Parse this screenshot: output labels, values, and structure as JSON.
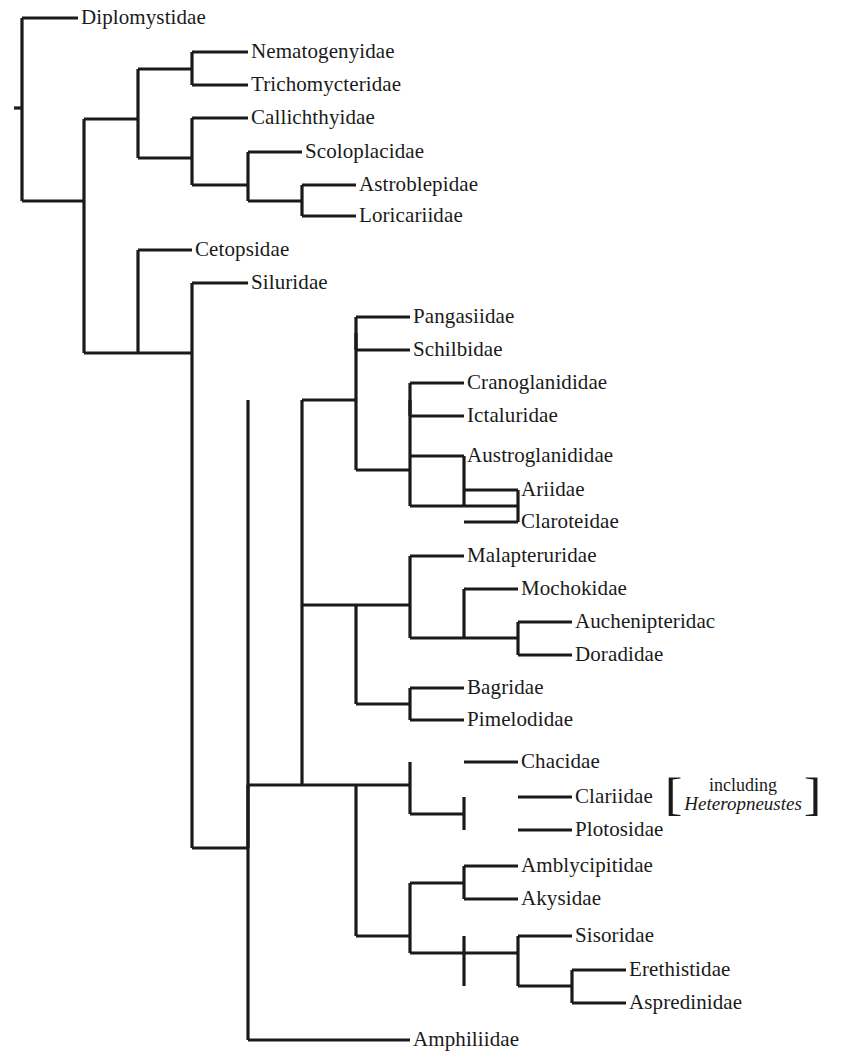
{
  "figure": {
    "kind": "cladogram",
    "line_color": "#1a1a1a",
    "background_color": "#ffffff",
    "line_width": 3.2
  },
  "tips": [
    {
      "id": "diplomystidae",
      "label": "Diplomystidae",
      "branch_x1": 22,
      "branch_x2": 78,
      "y": 18,
      "label_x": 81
    },
    {
      "id": "nematogenyidae",
      "label": "Nematogenyidae",
      "branch_x1": 192,
      "branch_x2": 248,
      "y": 52,
      "label_x": 251
    },
    {
      "id": "trichomycteridae",
      "label": "Trichomycteridae",
      "branch_x1": 192,
      "branch_x2": 248,
      "y": 85,
      "label_x": 251
    },
    {
      "id": "callichthyidae",
      "label": "Callichthyidae",
      "branch_x1": 192,
      "branch_x2": 248,
      "y": 118,
      "label_x": 251
    },
    {
      "id": "scoloplacidae",
      "label": "Scoloplacidae",
      "branch_x1": 248,
      "branch_x2": 302,
      "y": 152,
      "label_x": 305
    },
    {
      "id": "astroblepidae",
      "label": "Astroblepidae",
      "branch_x1": 302,
      "branch_x2": 356,
      "y": 185,
      "label_x": 359
    },
    {
      "id": "loricariidae",
      "label": "Loricariidae",
      "branch_x1": 302,
      "branch_x2": 356,
      "y": 216,
      "label_x": 359
    },
    {
      "id": "cetopsidae",
      "label": "Cetopsidae",
      "branch_x1": 138,
      "branch_x2": 192,
      "y": 250,
      "label_x": 195
    },
    {
      "id": "siluridae",
      "label": "Siluridae",
      "branch_x1": 192,
      "branch_x2": 248,
      "y": 283,
      "label_x": 251
    },
    {
      "id": "pangasiidae",
      "label": "Pangasiidae",
      "branch_x1": 356,
      "branch_x2": 410,
      "y": 317,
      "label_x": 413
    },
    {
      "id": "schilbidae",
      "label": "Schilbidae",
      "branch_x1": 356,
      "branch_x2": 410,
      "y": 350,
      "label_x": 413
    },
    {
      "id": "cranoglanididae",
      "label": "Cranoglanididae",
      "branch_x1": 410,
      "branch_x2": 464,
      "y": 383,
      "label_x": 467
    },
    {
      "id": "ictaluridae",
      "label": "Ictaluridae",
      "branch_x1": 410,
      "branch_x2": 464,
      "y": 416,
      "label_x": 467
    },
    {
      "id": "austroglanididae",
      "label": "Austroglanididae",
      "branch_x1": 410,
      "branch_x2": 464,
      "y": 456,
      "label_x": 467
    },
    {
      "id": "ariidae",
      "label": "Ariidae",
      "branch_x1": 464,
      "branch_x2": 518,
      "y": 490,
      "label_x": 521
    },
    {
      "id": "claroteidae",
      "label": "Claroteidae",
      "branch_x1": 464,
      "branch_x2": 518,
      "y": 522,
      "label_x": 521
    },
    {
      "id": "malapteruridae",
      "label": "Malapteruridae",
      "branch_x1": 410,
      "branch_x2": 464,
      "y": 556,
      "label_x": 467
    },
    {
      "id": "mochokidae",
      "label": "Mochokidae",
      "branch_x1": 464,
      "branch_x2": 518,
      "y": 589,
      "label_x": 521
    },
    {
      "id": "auchenipteridae",
      "label": "Auchenipteridac",
      "branch_x1": 518,
      "branch_x2": 572,
      "y": 622,
      "label_x": 575
    },
    {
      "id": "doradidae",
      "label": "Doradidae",
      "branch_x1": 518,
      "branch_x2": 572,
      "y": 655,
      "label_x": 575
    },
    {
      "id": "bagridae",
      "label": "Bagridae",
      "branch_x1": 410,
      "branch_x2": 464,
      "y": 688,
      "label_x": 467
    },
    {
      "id": "pimelodidae",
      "label": "Pimelodidae",
      "branch_x1": 410,
      "branch_x2": 464,
      "y": 720,
      "label_x": 467
    },
    {
      "id": "chacidae",
      "label": "Chacidae",
      "branch_x1": 464,
      "branch_x2": 518,
      "y": 762,
      "label_x": 521
    },
    {
      "id": "clariidae",
      "label": "Clariidae",
      "branch_x1": 518,
      "branch_x2": 572,
      "y": 797,
      "label_x": 575
    },
    {
      "id": "plotosidae",
      "label": "Plotosidae",
      "branch_x1": 518,
      "branch_x2": 572,
      "y": 830,
      "label_x": 575
    },
    {
      "id": "amblycipitidae",
      "label": "Amblycipitidae",
      "branch_x1": 464,
      "branch_x2": 518,
      "y": 866,
      "label_x": 521
    },
    {
      "id": "akysidae",
      "label": "Akysidae",
      "branch_x1": 464,
      "branch_x2": 518,
      "y": 899,
      "label_x": 521
    },
    {
      "id": "sisoridae",
      "label": "Sisoridae",
      "branch_x1": 518,
      "branch_x2": 572,
      "y": 936,
      "label_x": 575
    },
    {
      "id": "erethistidae",
      "label": "Erethistidae",
      "branch_x1": 572,
      "branch_x2": 626,
      "y": 970,
      "label_x": 629
    },
    {
      "id": "aspredinidae",
      "label": "Aspredinidae",
      "branch_x1": 572,
      "branch_x2": 626,
      "y": 1003,
      "label_x": 629
    },
    {
      "id": "amphiliidae",
      "label": "Amphiliidae",
      "branch_x1": 356,
      "branch_x2": 410,
      "y": 1040,
      "label_x": 413
    }
  ],
  "nodes": [
    {
      "id": "n-root",
      "x": 22,
      "y_top": 18,
      "y_bottom": 201,
      "stem_x1": 14,
      "stem_x2": 22,
      "stem_y": 108
    },
    {
      "id": "n-siluriformes",
      "x": 84,
      "y_top": 119,
      "y_bottom": 353,
      "stem_x1": 22,
      "stem_x2": 84,
      "stem_y": 201
    },
    {
      "id": "n-loricarioidei",
      "x": 138,
      "y_top": 69,
      "y_bottom": 158,
      "stem_x1": 84,
      "stem_x2": 138,
      "stem_y": 119
    },
    {
      "id": "n-nemato-tricho",
      "x": 192,
      "y_top": 52,
      "y_bottom": 85,
      "stem_x1": 138,
      "stem_x2": 192,
      "stem_y": 69
    },
    {
      "id": "n-callich-clade",
      "x": 192,
      "y_top": 118,
      "y_bottom": 185,
      "stem_x1": 138,
      "stem_x2": 192,
      "stem_y": 158
    },
    {
      "id": "n-scolo-clade",
      "x": 248,
      "y_top": 152,
      "y_bottom": 201,
      "stem_x1": 192,
      "stem_x2": 248,
      "stem_y": 185
    },
    {
      "id": "n-astro-lorica",
      "x": 302,
      "y_top": 185,
      "y_bottom": 216,
      "stem_x1": 248,
      "stem_x2": 302,
      "stem_y": 201
    },
    {
      "id": "n-cetopsid-clade",
      "x": 138,
      "y_top": 250,
      "y_bottom": 353,
      "stem_x1": 84,
      "stem_x2": 138,
      "stem_y": 353
    },
    {
      "id": "n-silurid-clade",
      "x": 192,
      "y_top": 283,
      "y_bottom": 848,
      "stem_x1": 138,
      "stem_x2": 192,
      "stem_y": 353
    },
    {
      "id": "n-siluroidei",
      "x": 248,
      "y_top": 400,
      "y_bottom": 848,
      "stem_x1": 192,
      "stem_x2": 248,
      "stem_y": 848
    },
    {
      "id": "n-big-clade",
      "x": 302,
      "y_top": 400,
      "y_bottom": 785,
      "stem_x1": 248,
      "stem_x2": 302,
      "stem_y": 785
    },
    {
      "id": "n-pangas-ictal",
      "x": 356,
      "y_top": 333,
      "y_bottom": 470,
      "stem_x1": 302,
      "stem_x2": 356,
      "stem_y": 400
    },
    {
      "id": "n-pangas-schilb",
      "x": 356,
      "y_top": 317,
      "y_bottom": 350,
      "stem_x1": 356,
      "stem_x2": 356,
      "stem_y": 333
    },
    {
      "id": "n-ictal-group",
      "x": 410,
      "y_top": 400,
      "y_bottom": 506,
      "stem_x1": 356,
      "stem_x2": 410,
      "stem_y": 470
    },
    {
      "id": "n-crano-ictal",
      "x": 410,
      "y_top": 383,
      "y_bottom": 416,
      "stem_x1": 410,
      "stem_x2": 410,
      "stem_y": 400
    },
    {
      "id": "n-austro-group",
      "x": 464,
      "y_top": 456,
      "y_bottom": 506,
      "stem_x1": 410,
      "stem_x2": 464,
      "stem_y": 506
    },
    {
      "id": "n-arii-clarot",
      "x": 518,
      "y_top": 490,
      "y_bottom": 522,
      "stem_x1": 464,
      "stem_x2": 518,
      "stem_y": 506
    },
    {
      "id": "n-malapt-bagrid",
      "x": 356,
      "y_top": 605,
      "y_bottom": 704,
      "stem_x1": 302,
      "stem_x2": 356,
      "stem_y": 605
    },
    {
      "id": "n-malapt-group",
      "x": 410,
      "y_top": 556,
      "y_bottom": 638,
      "stem_x1": 356,
      "stem_x2": 410,
      "stem_y": 605
    },
    {
      "id": "n-mochok-group",
      "x": 464,
      "y_top": 589,
      "y_bottom": 638,
      "stem_x1": 410,
      "stem_x2": 464,
      "stem_y": 638
    },
    {
      "id": "n-auchen-dorad",
      "x": 518,
      "y_top": 622,
      "y_bottom": 655,
      "stem_x1": 464,
      "stem_x2": 518,
      "stem_y": 638
    },
    {
      "id": "n-bagrid-pimelo",
      "x": 410,
      "y_top": 688,
      "y_bottom": 720,
      "stem_x1": 356,
      "stem_x2": 410,
      "stem_y": 704
    },
    {
      "id": "n-chac-sisor",
      "x": 356,
      "y_top": 785,
      "y_bottom": 936,
      "stem_x1": 302,
      "stem_x2": 356,
      "stem_y": 785
    },
    {
      "id": "n-chac-group",
      "x": 410,
      "y_top": 762,
      "y_bottom": 814,
      "stem_x1": 356,
      "stem_x2": 410,
      "stem_y": 785
    },
    {
      "id": "n-clari-plotos",
      "x": 464,
      "y_top": 797,
      "y_bottom": 830,
      "stem_x1": 410,
      "stem_x2": 464,
      "stem_y": 814
    },
    {
      "id": "n-amblyc-group",
      "x": 410,
      "y_top": 883,
      "y_bottom": 953,
      "stem_x1": 356,
      "stem_x2": 410,
      "stem_y": 936
    },
    {
      "id": "n-ambl-akys",
      "x": 464,
      "y_top": 866,
      "y_bottom": 899,
      "stem_x1": 410,
      "stem_x2": 464,
      "stem_y": 883
    },
    {
      "id": "n-sisor-group",
      "x": 464,
      "y_top": 936,
      "y_bottom": 986,
      "stem_x1": 410,
      "stem_x2": 464,
      "stem_y": 953
    },
    {
      "id": "n-ereth-aspred",
      "x": 572,
      "y_top": 970,
      "y_bottom": 1003,
      "stem_x1": 518,
      "stem_x2": 572,
      "stem_y": 986
    },
    {
      "id": "n-sisor-parent",
      "x": 518,
      "y_top": 936,
      "y_bottom": 986,
      "stem_x1": 464,
      "stem_x2": 518,
      "stem_y": 953
    },
    {
      "id": "n-amphil-stem",
      "x": 248,
      "y_top": 785,
      "y_bottom": 1040,
      "stem_x1": 248,
      "stem_x2": 356,
      "stem_y": 1040
    }
  ],
  "annotation": {
    "id": "heteropneustes-note",
    "line_1": "including",
    "line_2": "Heteropneustes",
    "bracket_open": "[",
    "bracket_close": "]",
    "x": 666,
    "y": 776
  }
}
